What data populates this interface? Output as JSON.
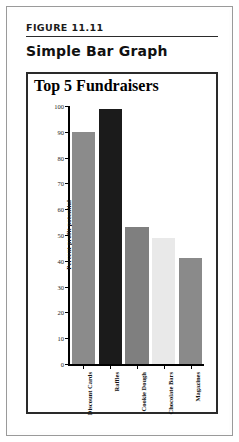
{
  "figure": {
    "label": "FIGURE 11.11",
    "caption": "Simple Bar Graph"
  },
  "chart_data": {
    "type": "bar",
    "title": "Top 5 Fundraisers",
    "xlabel": "",
    "ylabel": "Percent profit potential",
    "categories": [
      "Discount Cards",
      "Raffles",
      "Cookie Dough",
      "Chocolate Bars",
      "Magazines"
    ],
    "values": [
      90,
      99,
      53,
      49,
      41
    ],
    "bar_colors": [
      "#8b8b8b",
      "#1b1b1b",
      "#7f7f7f",
      "#e9e9e9",
      "#8a8a8a"
    ],
    "ylim": [
      0,
      100
    ],
    "yticks": [
      100,
      90,
      80,
      70,
      60,
      50,
      40,
      30,
      20,
      10,
      0
    ],
    "grid": false,
    "legend": false
  },
  "colors": {
    "axis": "#000000",
    "frame": "#2a2a2a",
    "page": "#ffffff"
  }
}
